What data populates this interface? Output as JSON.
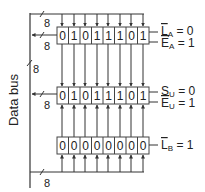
{
  "diagram": {
    "bus_label": "Data bus",
    "bus_width_labels": [
      "8",
      "8",
      "8",
      "8",
      "8"
    ],
    "registers": [
      {
        "name": "A",
        "bits": [
          "0",
          "1",
          "0",
          "1",
          "1",
          "1",
          "0",
          "1"
        ],
        "controls": [
          {
            "label": "L",
            "sub": "A",
            "value": "= 0"
          },
          {
            "label": "E",
            "sub": "A",
            "value": "= 1"
          }
        ]
      },
      {
        "name": "U",
        "bits": [
          "0",
          "1",
          "0",
          "1",
          "1",
          "1",
          "0",
          "1"
        ],
        "controls": [
          {
            "label": "S",
            "sub": "U",
            "value": "= 0"
          },
          {
            "label": "E",
            "sub": "U",
            "value": "= 1"
          }
        ]
      },
      {
        "name": "B",
        "bits": [
          "0",
          "0",
          "0",
          "0",
          "0",
          "0",
          "0",
          "0"
        ],
        "controls": [
          {
            "label": "L",
            "sub": "B",
            "value": "= 1"
          }
        ]
      }
    ],
    "colors": {
      "line": "#333333",
      "box": "#444444",
      "text": "#222222"
    }
  }
}
